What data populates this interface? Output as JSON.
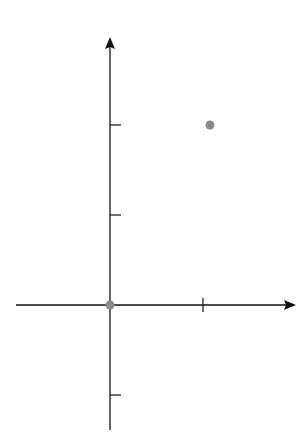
{
  "chart_data": {
    "type": "line",
    "title": "",
    "xlabel": "x",
    "ylabel": "y",
    "xlim": [
      -1.0,
      1.8
    ],
    "ylim": [
      -1.4,
      2.8
    ],
    "grid": true,
    "grid_step_x": 0.2,
    "grid_step_y": 0.2,
    "x_ticks": [
      {
        "value": 0,
        "label": "0"
      },
      {
        "value": 1,
        "label": "1"
      }
    ],
    "y_ticks": [
      {
        "value": -1,
        "label": "−1"
      },
      {
        "value": 1,
        "label": "1"
      },
      {
        "value": 2,
        "label": "2"
      }
    ],
    "series": [
      {
        "name": "y = tan x",
        "color": "#8a8a8a",
        "x": [
          -0.97,
          -0.9,
          -0.8,
          -0.6,
          -0.4,
          -0.2,
          0,
          0.2,
          0.4,
          0.6,
          0.8,
          1.0,
          1.107,
          1.2,
          1.26
        ],
        "y": [
          -1.46,
          -1.26,
          -1.03,
          -0.68,
          -0.42,
          -0.2,
          0,
          0.2,
          0.42,
          0.68,
          1.03,
          1.56,
          2.0,
          2.57,
          3.1
        ]
      }
    ],
    "points": [
      {
        "name": "P1",
        "label": "P",
        "sub": "1",
        "x": 0,
        "y": 0
      },
      {
        "name": "P2",
        "label": "P",
        "sub": "2",
        "x": 1.107,
        "y": 2
      }
    ]
  },
  "labels": {
    "x_axis": "x",
    "y_axis": "y",
    "tick_x0": "0",
    "tick_x1": "1",
    "tick_y1": "1",
    "tick_y2": "2",
    "tick_yneg1": "−1",
    "p1_main": "P",
    "p1_sub": "1",
    "p2_main": "P",
    "p2_sub": "2"
  }
}
